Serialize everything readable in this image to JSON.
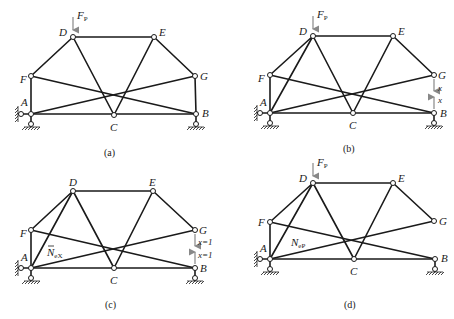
{
  "figure": {
    "panels": [
      {
        "id": "a",
        "caption": "(a)",
        "load_label": "F",
        "load_sub": "P",
        "joints": {
          "A": "A",
          "B": "B",
          "C": "C",
          "D": "D",
          "E": "E",
          "F": "F",
          "G": "G"
        }
      },
      {
        "id": "b",
        "caption": "(b)",
        "load_label": "F",
        "load_sub": "P",
        "redundant_top": "x",
        "redundant_bottom": "x",
        "joints": {
          "A": "A",
          "B": "B",
          "C": "C",
          "D": "D",
          "E": "E",
          "F": "F",
          "G": "G"
        }
      },
      {
        "id": "c",
        "caption": "(c)",
        "unit_top": "x=1",
        "unit_bottom": "x=1",
        "member_force_label": "N",
        "member_force_sub": "eX",
        "joints": {
          "A": "A",
          "B": "B",
          "C": "C",
          "D": "D",
          "E": "E",
          "F": "F",
          "G": "G"
        }
      },
      {
        "id": "d",
        "caption": "(d)",
        "load_label": "F",
        "load_sub": "P",
        "member_force_label": "N",
        "member_force_sub": "eP",
        "joints": {
          "A": "A",
          "B": "B",
          "C": "C",
          "D": "D",
          "E": "E",
          "F": "F",
          "G": "G"
        }
      }
    ]
  }
}
